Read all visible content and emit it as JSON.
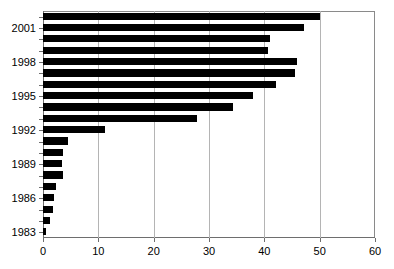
{
  "chart_data": {
    "type": "bar",
    "orientation": "horizontal",
    "title": "",
    "subtitle": "",
    "xlabel": "",
    "ylabel": "",
    "xlim": [
      0,
      60
    ],
    "xticks": [
      0,
      10,
      20,
      30,
      40,
      50,
      60
    ],
    "xtick_labels": [
      "0",
      "10",
      "20",
      "30",
      "40",
      "50",
      "60"
    ],
    "grid": "vertical",
    "legend": null,
    "bar_color": "#000000",
    "grid_color": "#b4b4b4",
    "axis_color": "#6e6e6e",
    "categories": [
      "2002",
      "2001",
      "2000",
      "1999",
      "1998",
      "1997",
      "1996",
      "1995",
      "1994",
      "1993",
      "1992",
      "1991",
      "1990",
      "1989",
      "1988",
      "1987",
      "1986",
      "1985",
      "1984",
      "1983"
    ],
    "values": [
      50.0,
      47.2,
      41.1,
      40.7,
      45.9,
      45.6,
      42.1,
      38.0,
      34.3,
      27.8,
      11.2,
      4.5,
      3.6,
      3.5,
      3.6,
      2.4,
      2.0,
      1.8,
      1.3,
      0.5
    ],
    "ytick_labels": [
      "2001",
      "1998",
      "1995",
      "1992",
      "1989",
      "1986",
      "1983"
    ],
    "ytick_categories": [
      "2001",
      "1998",
      "1995",
      "1992",
      "1989",
      "1986",
      "1983"
    ]
  }
}
